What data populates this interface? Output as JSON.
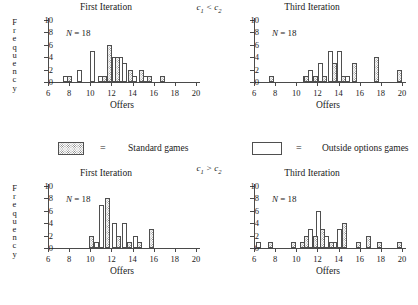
{
  "figure": {
    "top_group_label": "c1 < c2",
    "bottom_group_label": "c1 > c2",
    "c_symbol": "c",
    "sub1": "1",
    "sub2": "2",
    "lt": "<",
    "gt": ">",
    "axis_y_title": "Frequency",
    "axis_x_title": "Offers",
    "n_label": "N = 18",
    "first_iteration_title": "First Iteration",
    "third_iteration_title": "Third Iteration"
  },
  "legend": {
    "equals": "=",
    "hatched_label": "Standard games",
    "open_label": "Outside options games",
    "hatched_swatch": "standard-games-swatch",
    "open_swatch": "outside-options-swatch"
  },
  "chart_data": [
    {
      "id": "top-left",
      "type": "bar",
      "title": "First Iteration",
      "group": "c1 < c2",
      "xlabel": "Offers",
      "ylabel": "Frequency",
      "n": "N = 18",
      "xlim": [
        6,
        20
      ],
      "ylim": [
        0,
        10
      ],
      "xticks": [
        6,
        8,
        10,
        12,
        14,
        16,
        18,
        20
      ],
      "yticks": [
        0,
        2,
        4,
        6,
        8,
        10
      ],
      "grid": false,
      "series": [
        {
          "name": "Outside options games",
          "style": "open",
          "points": [
            {
              "x": 7.7,
              "y": 1
            },
            {
              "x": 9.0,
              "y": 2
            },
            {
              "x": 10.2,
              "y": 5
            },
            {
              "x": 11.0,
              "y": 1
            },
            {
              "x": 12.3,
              "y": 4
            },
            {
              "x": 12.9,
              "y": 4
            },
            {
              "x": 13.2,
              "y": 3
            },
            {
              "x": 14.2,
              "y": 1
            },
            {
              "x": 15.2,
              "y": 1
            }
          ]
        },
        {
          "name": "Standard games",
          "style": "hatched",
          "points": [
            {
              "x": 8.0,
              "y": 1
            },
            {
              "x": 11.3,
              "y": 1
            },
            {
              "x": 11.8,
              "y": 6
            },
            {
              "x": 12.6,
              "y": 4
            },
            {
              "x": 13.8,
              "y": 2
            },
            {
              "x": 14.8,
              "y": 2
            },
            {
              "x": 15.6,
              "y": 1
            },
            {
              "x": 16.8,
              "y": 1
            }
          ]
        }
      ]
    },
    {
      "id": "top-right",
      "type": "bar",
      "title": "Third Iteration",
      "group": "c1 < c2",
      "xlabel": "Offers",
      "ylabel": "Frequency",
      "n": "N = 18",
      "xlim": [
        6,
        20
      ],
      "ylim": [
        0,
        10
      ],
      "xticks": [
        6,
        8,
        10,
        12,
        14,
        16,
        18,
        20
      ],
      "yticks": [
        0,
        2,
        4,
        6,
        8,
        10
      ],
      "grid": false,
      "series": [
        {
          "name": "Outside options games",
          "style": "open",
          "points": [
            {
              "x": 10.9,
              "y": 1
            },
            {
              "x": 11.3,
              "y": 2
            },
            {
              "x": 12.3,
              "y": 3
            },
            {
              "x": 13.2,
              "y": 5
            },
            {
              "x": 14.1,
              "y": 5
            },
            {
              "x": 14.8,
              "y": 1
            }
          ]
        },
        {
          "name": "Standard games",
          "style": "hatched",
          "points": [
            {
              "x": 7.7,
              "y": 1
            },
            {
              "x": 11.0,
              "y": 1
            },
            {
              "x": 11.8,
              "y": 1
            },
            {
              "x": 12.7,
              "y": 1
            },
            {
              "x": 13.6,
              "y": 3
            },
            {
              "x": 14.5,
              "y": 1
            },
            {
              "x": 15.5,
              "y": 3
            },
            {
              "x": 17.6,
              "y": 4
            },
            {
              "x": 19.8,
              "y": 2
            }
          ]
        }
      ]
    },
    {
      "id": "bottom-left",
      "type": "bar",
      "title": "First Iteration",
      "group": "c1 > c2",
      "xlabel": "Offers",
      "ylabel": "Frequency",
      "n": "N = 18",
      "xlim": [
        6,
        20
      ],
      "ylim": [
        0,
        10
      ],
      "xticks": [
        6,
        8,
        10,
        12,
        14,
        16,
        18,
        20
      ],
      "yticks": [
        0,
        2,
        4,
        6,
        8,
        10
      ],
      "grid": false,
      "series": [
        {
          "name": "Outside options games",
          "style": "open",
          "points": [
            {
              "x": 10.6,
              "y": 1
            },
            {
              "x": 11.1,
              "y": 7
            },
            {
              "x": 12.3,
              "y": 4
            },
            {
              "x": 13.2,
              "y": 4
            },
            {
              "x": 14.3,
              "y": 2
            }
          ]
        },
        {
          "name": "Standard games",
          "style": "hatched",
          "points": [
            {
              "x": 10.1,
              "y": 2
            },
            {
              "x": 11.6,
              "y": 8
            },
            {
              "x": 12.7,
              "y": 2
            },
            {
              "x": 13.7,
              "y": 1
            },
            {
              "x": 14.7,
              "y": 1
            },
            {
              "x": 15.8,
              "y": 3
            }
          ]
        }
      ]
    },
    {
      "id": "bottom-right",
      "type": "bar",
      "title": "Third Iteration",
      "group": "c1 > c2",
      "xlabel": "Offers",
      "ylabel": "Frequency",
      "n": "N = 18",
      "xlim": [
        6,
        20
      ],
      "ylim": [
        0,
        10
      ],
      "xticks": [
        6,
        8,
        10,
        12,
        14,
        16,
        18,
        20
      ],
      "yticks": [
        0,
        2,
        4,
        6,
        8,
        10
      ],
      "grid": false,
      "series": [
        {
          "name": "Outside options games",
          "style": "open",
          "points": [
            {
              "x": 6.4,
              "y": 1
            },
            {
              "x": 11.3,
              "y": 3
            },
            {
              "x": 12.1,
              "y": 6
            },
            {
              "x": 12.9,
              "y": 2
            },
            {
              "x": 13.6,
              "y": 1
            },
            {
              "x": 14.1,
              "y": 3
            }
          ]
        },
        {
          "name": "Standard games",
          "style": "hatched",
          "points": [
            {
              "x": 7.6,
              "y": 1
            },
            {
              "x": 9.7,
              "y": 1
            },
            {
              "x": 10.6,
              "y": 1
            },
            {
              "x": 11.0,
              "y": 2
            },
            {
              "x": 11.8,
              "y": 2
            },
            {
              "x": 12.5,
              "y": 3
            },
            {
              "x": 13.3,
              "y": 1
            },
            {
              "x": 14.6,
              "y": 4
            },
            {
              "x": 15.9,
              "y": 1
            },
            {
              "x": 16.8,
              "y": 2
            },
            {
              "x": 17.9,
              "y": 1
            },
            {
              "x": 19.8,
              "y": 1
            }
          ]
        }
      ]
    }
  ]
}
